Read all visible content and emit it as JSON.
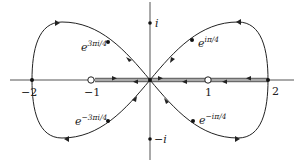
{
  "figure": {
    "axes": {
      "x_ticks": [
        {
          "value": -2,
          "label": "−2"
        },
        {
          "value": -1,
          "label": "−1"
        },
        {
          "value": 1,
          "label": "1"
        },
        {
          "value": 2,
          "label": "2"
        }
      ],
      "y_ticks": [
        {
          "value": 1,
          "label": "i"
        },
        {
          "value": -1,
          "label": "−i"
        }
      ]
    },
    "point_labels": {
      "upper_right": {
        "base": "e",
        "exponent": "iπ/4"
      },
      "upper_left": {
        "base": "e",
        "exponent": "3πi/4"
      },
      "lower_left": {
        "base": "e",
        "exponent": "−3πi/4"
      },
      "lower_right": {
        "base": "e",
        "exponent": "−iπ/4"
      }
    },
    "special_points": {
      "open_circle_left": "-1",
      "open_circle_right": "1",
      "filled_points": [
        "-2",
        "2",
        "0",
        "i",
        "-i"
      ]
    },
    "colors": {
      "curve": "#222222",
      "axis": "#555555",
      "background": "#ffffff"
    }
  }
}
